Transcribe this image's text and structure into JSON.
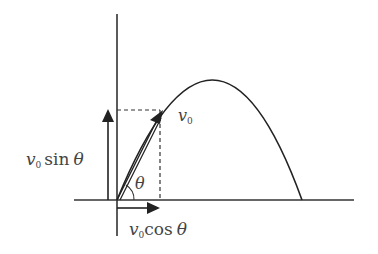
{
  "diagram": {
    "colors": {
      "stroke": "#222222",
      "label": "#444444",
      "background": "#ffffff"
    },
    "labels": {
      "v0": {
        "var": "v",
        "sub": "0"
      },
      "v0_sin": {
        "var": "v",
        "sub": "0",
        "func": "sin",
        "angle": "θ"
      },
      "v0_cos": {
        "var": "v",
        "sub": "0",
        "func": "cos",
        "angle": "θ"
      },
      "angle": "θ"
    },
    "elements": [
      "horizontal-axis",
      "vertical-axis",
      "parabolic-trajectory",
      "initial-velocity-vector",
      "vertical-component-arrow",
      "horizontal-component-arrow",
      "dashed-projection-lines",
      "angle-arc"
    ]
  }
}
